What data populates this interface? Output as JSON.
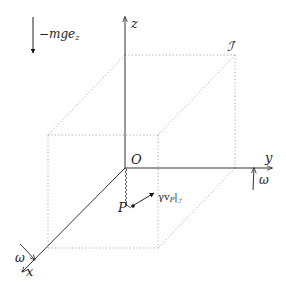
{
  "diagram": {
    "axes": {
      "x_label": "x",
      "y_label": "y",
      "z_label": "z",
      "origin_label": "O"
    },
    "frame_label": "ℐ′",
    "point_label": "P",
    "gravity_label": "−mge",
    "gravity_sub": "z",
    "drag_label_prefix": "γv",
    "drag_label_sub": "P",
    "drag_label_bar": "|",
    "drag_label_frame": "ℐ′",
    "omega_x_label": "ω",
    "omega_y_label": "ω",
    "colors": {
      "axis": "#333333",
      "box_dotted": "#aaaaaa",
      "text": "#222222"
    }
  }
}
